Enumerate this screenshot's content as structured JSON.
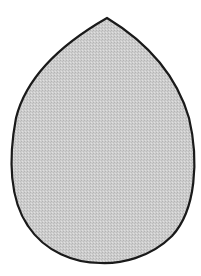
{
  "figure": {
    "shape": "teardrop-egg",
    "fill": "#c8c8c8",
    "stroke": "#1a1a1a",
    "background": "#ffffff"
  }
}
